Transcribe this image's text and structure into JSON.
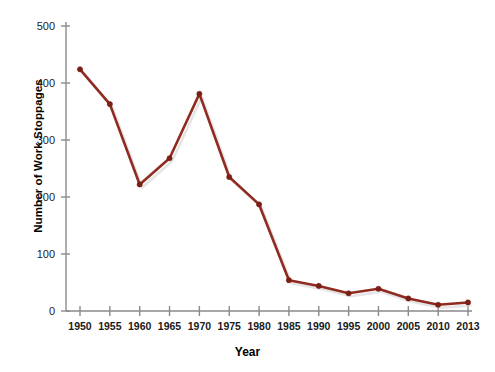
{
  "chart_data": {
    "type": "line",
    "title": "",
    "xlabel": "Year",
    "ylabel": "Number of Work Stoppages",
    "x": [
      1950,
      1955,
      1960,
      1965,
      1970,
      1975,
      1980,
      1985,
      1990,
      1995,
      2000,
      2005,
      2010,
      2013
    ],
    "values": [
      424,
      363,
      222,
      268,
      381,
      235,
      187,
      54,
      44,
      31,
      39,
      22,
      11,
      15
    ],
    "categories": [
      "1950",
      "1955",
      "1960",
      "1965",
      "1970",
      "1975",
      "1980",
      "1985",
      "1990",
      "1995",
      "2000",
      "2005",
      "2010",
      "2013"
    ],
    "xtick_labels": [
      "1950",
      "1955",
      "1960",
      "1965",
      "1970",
      "1975",
      "1980",
      "1985",
      "1990",
      "1995",
      "2000",
      "2005",
      "2010",
      "2013"
    ],
    "ytick_labels": [
      "0",
      "100",
      "200",
      "300",
      "400",
      "500"
    ],
    "ytick_values": [
      0,
      100,
      200,
      300,
      400,
      500
    ],
    "ylim": [
      0,
      500
    ],
    "xlim": [
      1950,
      2013
    ],
    "grid": false,
    "legend": false,
    "series_color": "#8f2b20",
    "marker": "circle"
  },
  "axes": {
    "y_title": "Number of Work Stoppages",
    "x_title": "Year"
  }
}
